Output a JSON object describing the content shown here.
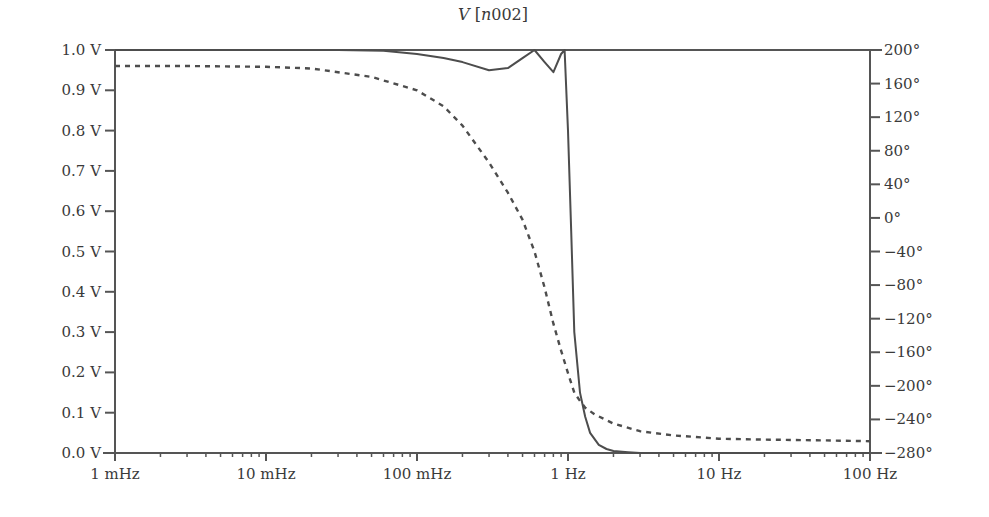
{
  "chart_data": {
    "type": "line",
    "title": "V [n002]",
    "title_parts": {
      "var": "V",
      "node": "n002"
    },
    "xlabel": "",
    "x_scale": "log",
    "xlim_hz": [
      0.001,
      100
    ],
    "x_ticks": [
      {
        "value": 0.001,
        "label": "1 mHz"
      },
      {
        "value": 0.01,
        "label": "10 mHz"
      },
      {
        "value": 0.1,
        "label": "100 mHz"
      },
      {
        "value": 1,
        "label": "1 Hz"
      },
      {
        "value": 10,
        "label": "10 Hz"
      },
      {
        "value": 100,
        "label": "100 Hz"
      }
    ],
    "ylabel_left": "",
    "ylim_left": [
      0.0,
      1.0
    ],
    "y_ticks_left": [
      {
        "value": 1.0,
        "label": "1.0 V"
      },
      {
        "value": 0.9,
        "label": "0.9 V"
      },
      {
        "value": 0.8,
        "label": "0.8 V"
      },
      {
        "value": 0.7,
        "label": "0.7 V"
      },
      {
        "value": 0.6,
        "label": "0.6 V"
      },
      {
        "value": 0.5,
        "label": "0.5 V"
      },
      {
        "value": 0.4,
        "label": "0.4 V"
      },
      {
        "value": 0.3,
        "label": "0.3 V"
      },
      {
        "value": 0.2,
        "label": "0.2 V"
      },
      {
        "value": 0.1,
        "label": "0.1 V"
      },
      {
        "value": 0.0,
        "label": "0.0 V"
      }
    ],
    "ylabel_right": "",
    "ylim_right": [
      -280,
      200
    ],
    "y_ticks_right": [
      {
        "value": 200,
        "label": "200°"
      },
      {
        "value": 160,
        "label": "160°"
      },
      {
        "value": 120,
        "label": "120°"
      },
      {
        "value": 80,
        "label": "80°"
      },
      {
        "value": 40,
        "label": "40°"
      },
      {
        "value": 0,
        "label": "0°"
      },
      {
        "value": -40,
        "label": "−40°"
      },
      {
        "value": -80,
        "label": "−80°"
      },
      {
        "value": -120,
        "label": "−120°"
      },
      {
        "value": -160,
        "label": "−160°"
      },
      {
        "value": -200,
        "label": "−200°"
      },
      {
        "value": -240,
        "label": "−240°"
      },
      {
        "value": -280,
        "label": "−280°"
      }
    ],
    "grid": false,
    "legend": null,
    "series": [
      {
        "name": "magnitude",
        "axis": "left",
        "unit": "V",
        "style": "solid",
        "x": [
          0.001,
          0.01,
          0.03,
          0.06,
          0.1,
          0.15,
          0.2,
          0.3,
          0.4,
          0.5,
          0.6,
          0.7,
          0.8,
          0.9,
          0.95,
          1.0,
          1.05,
          1.1,
          1.2,
          1.3,
          1.4,
          1.6,
          1.8,
          2.0,
          2.5,
          3.0,
          10,
          100
        ],
        "values": [
          1.0,
          1.0,
          1.0,
          0.998,
          0.99,
          0.98,
          0.97,
          0.95,
          0.955,
          0.98,
          1.0,
          0.97,
          0.945,
          0.99,
          1.0,
          0.8,
          0.55,
          0.3,
          0.15,
          0.09,
          0.05,
          0.02,
          0.01,
          0.005,
          0.002,
          0.0,
          0.0,
          0.0
        ]
      },
      {
        "name": "phase",
        "axis": "right",
        "unit": "deg",
        "style": "dashed",
        "x": [
          0.001,
          0.003,
          0.01,
          0.02,
          0.05,
          0.1,
          0.15,
          0.2,
          0.3,
          0.4,
          0.5,
          0.6,
          0.7,
          0.8,
          0.9,
          1.0,
          1.1,
          1.2,
          1.3,
          1.5,
          2.0,
          3.0,
          5.0,
          10,
          20,
          50,
          100
        ],
        "values": [
          181,
          181,
          180,
          178,
          168,
          152,
          133,
          110,
          66,
          30,
          -2,
          -40,
          -83,
          -126,
          -158,
          -185,
          -208,
          -218,
          -226,
          -234,
          -245,
          -254,
          -259,
          -263,
          -264,
          -265,
          -266
        ]
      }
    ]
  }
}
